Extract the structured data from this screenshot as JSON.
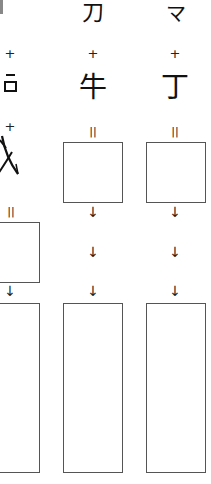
{
  "worksheet": {
    "columns": [
      {
        "id": "col-1",
        "components": [
          "",
          "⺊",
          "戈"
        ],
        "operators": [
          "+",
          "+"
        ],
        "equals": "=",
        "arrows": [
          "↓"
        ]
      },
      {
        "id": "col-2",
        "components": [
          "刀",
          "牛"
        ],
        "operators": [
          "+"
        ],
        "equals": "=",
        "arrows": [
          "↓",
          "↓",
          "↓"
        ]
      },
      {
        "id": "col-3",
        "components": [
          "マ",
          "丁"
        ],
        "operators": [
          "+"
        ],
        "equals": "=",
        "arrows": [
          "↓",
          "↓",
          "↓"
        ]
      }
    ],
    "colors": {
      "ink": "#111111",
      "box_border": "#555555",
      "background": "#ffffff"
    }
  }
}
